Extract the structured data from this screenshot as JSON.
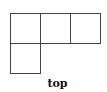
{
  "diagram": {
    "type": "net-view",
    "label": "top",
    "line_color": "#444444",
    "cells": [
      {
        "row": 0,
        "col": 0
      },
      {
        "row": 0,
        "col": 1
      },
      {
        "row": 0,
        "col": 2
      },
      {
        "row": 1,
        "col": 0
      }
    ]
  }
}
